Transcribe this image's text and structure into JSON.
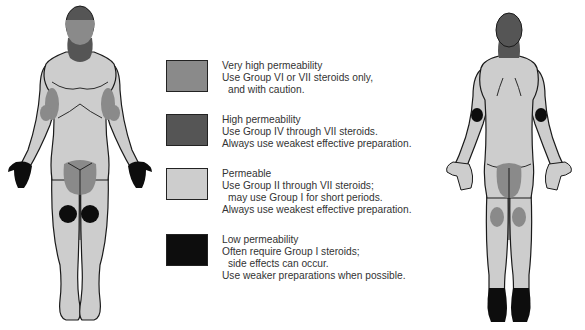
{
  "colors": {
    "very_high": "#8a8a8a",
    "high": "#555555",
    "permeable": "#cdcdcd",
    "low": "#0d0d0d",
    "outline": "#1a1a1a"
  },
  "legend": {
    "items": [
      {
        "key": "very_high",
        "title": "Very high permeability",
        "lines": [
          "Use Group VI or VII steroids only,",
          "and with caution."
        ]
      },
      {
        "key": "high",
        "title": "High permeability",
        "lines": [
          "Use Group IV through VII steroids.",
          "Always use weakest effective preparation."
        ]
      },
      {
        "key": "permeable",
        "title": "Permeable",
        "lines": [
          "Use Group II through VII steroids;",
          "may use Group I for short periods.",
          "Always use weakest effective preparation."
        ]
      },
      {
        "key": "low",
        "title": "Low permeability",
        "lines": [
          "Often require Group I steroids;",
          "side effects can occur.",
          "Use weaker preparations when possible."
        ]
      }
    ]
  },
  "figures": {
    "front": "anterior-body",
    "back": "posterior-body"
  }
}
